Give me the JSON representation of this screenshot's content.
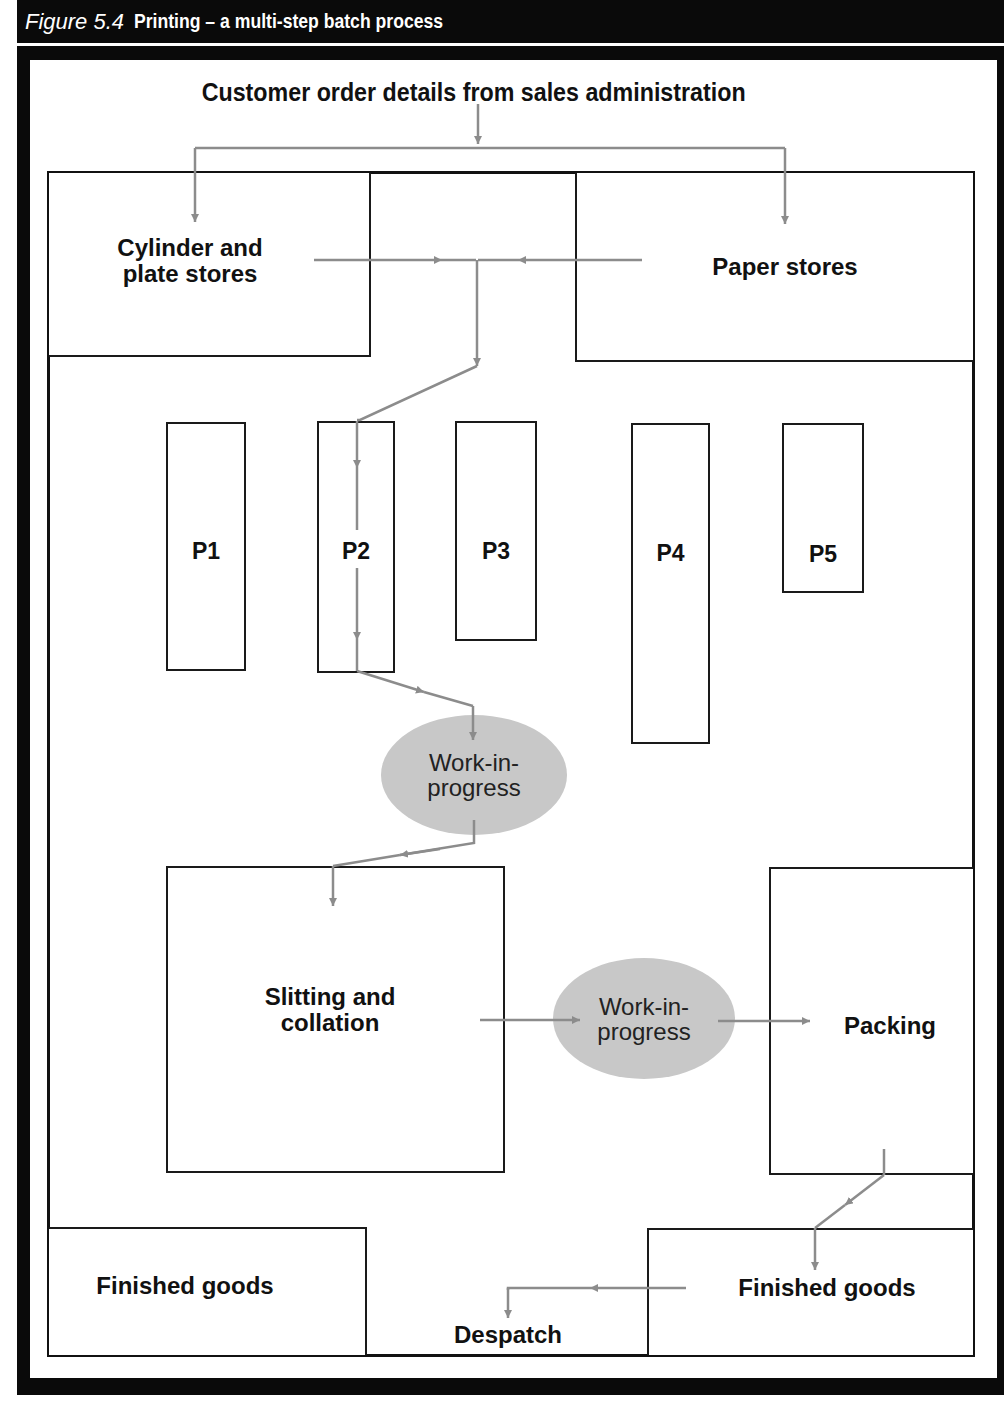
{
  "figure": {
    "number": "Figure 5.4",
    "title": "Printing – a multi-step batch process"
  },
  "diagram": {
    "source_label": "Customer order details from sales administration",
    "areas": {
      "cylinder_plate_stores": "Cylinder and\nplate stores",
      "paper_stores": "Paper stores",
      "slitting_collation": "Slitting and\ncollation",
      "packing": "Packing",
      "finished_goods_left": "Finished goods",
      "finished_goods_right": "Finished goods",
      "despatch": "Despatch"
    },
    "presses": [
      {
        "id": "P1",
        "label": "P1"
      },
      {
        "id": "P2",
        "label": "P2"
      },
      {
        "id": "P3",
        "label": "P3"
      },
      {
        "id": "P4",
        "label": "P4"
      },
      {
        "id": "P5",
        "label": "P5"
      }
    ],
    "wip_nodes": [
      {
        "label": "Work-in-\nprogress"
      },
      {
        "label": "Work-in-\nprogress"
      }
    ],
    "colors": {
      "frame": "#0a0a0a",
      "arrow": "#8c8c8c",
      "wip_fill": "#c8c8c8",
      "box_border": "#1a1a1a"
    },
    "flow": [
      "Customer order details from sales administration -> Cylinder and plate stores",
      "Customer order details from sales administration -> Paper stores",
      "Cylinder and plate stores -> P2",
      "Paper stores -> P2",
      "P2 -> Work-in-progress",
      "Work-in-progress -> Slitting and collation",
      "Slitting and collation -> Work-in-progress",
      "Work-in-progress -> Packing",
      "Packing -> Finished goods",
      "Finished goods -> Despatch"
    ]
  }
}
